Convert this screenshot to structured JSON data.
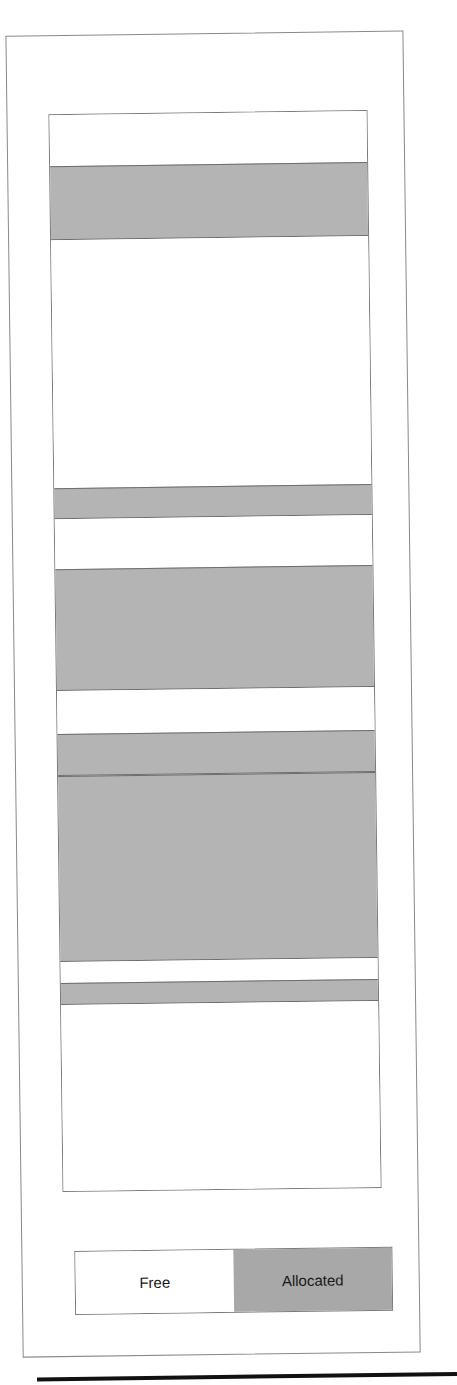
{
  "figure": {
    "colors": {
      "free": "#ffffff",
      "allocated": "#b4b4b4",
      "border": "#7a7a7a"
    },
    "segments": [
      {
        "state": "free",
        "start": 0,
        "size": 51
      },
      {
        "state": "allocated",
        "start": 51,
        "size": 74
      },
      {
        "state": "free",
        "start": 125,
        "size": 249
      },
      {
        "state": "allocated",
        "start": 374,
        "size": 31
      },
      {
        "state": "free",
        "start": 405,
        "size": 50
      },
      {
        "state": "allocated",
        "start": 455,
        "size": 122
      },
      {
        "state": "free",
        "start": 577,
        "size": 43
      },
      {
        "state": "allocated",
        "start": 620,
        "size": 42
      },
      {
        "state": "allocated",
        "start": 662,
        "size": 187
      },
      {
        "state": "free",
        "start": 849,
        "size": 21
      },
      {
        "state": "allocated",
        "start": 870,
        "size": 22
      },
      {
        "state": "free",
        "start": 892,
        "size": 186
      }
    ]
  },
  "legend": {
    "free_label": "Free",
    "allocated_label": "Allocated"
  }
}
